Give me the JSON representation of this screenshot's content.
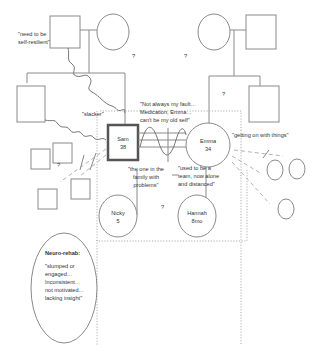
{
  "diagram": {
    "type": "genogram",
    "people": {
      "sam": {
        "name": "Sam",
        "age": "38"
      },
      "emma": {
        "name": "Emma",
        "age": "34"
      },
      "nicky": {
        "name": "Nicky",
        "age": "5"
      },
      "hannah": {
        "name": "Hannah",
        "age": "8mo"
      }
    },
    "quotes": {
      "self_resilient_1": "\"need to be",
      "self_resilient_2": "self-resilient\"",
      "slacker": "\"slacker\"",
      "not_my_fault_1": "\"Not always my fault…",
      "not_my_fault_2": "Medication, Emma…",
      "not_my_fault_3": "can't be my old self\"",
      "getting_on": "\"getting on with things\"",
      "one_in_family_1": "\"the one in the",
      "one_in_family_2": "family with",
      "one_in_family_3": "problems\"",
      "used_to_be_1": "\"used to be a",
      "used_to_be_2": "team, now alone",
      "used_to_be_3": "and distanced\""
    },
    "unknown_marker": "?",
    "neuro_rehab": {
      "title": "Neuro-rehab:",
      "lines": [
        "\"slumped or",
        "engaged…",
        "Inconsistent…",
        "not motivated…",
        "lacking insight\""
      ]
    }
  }
}
